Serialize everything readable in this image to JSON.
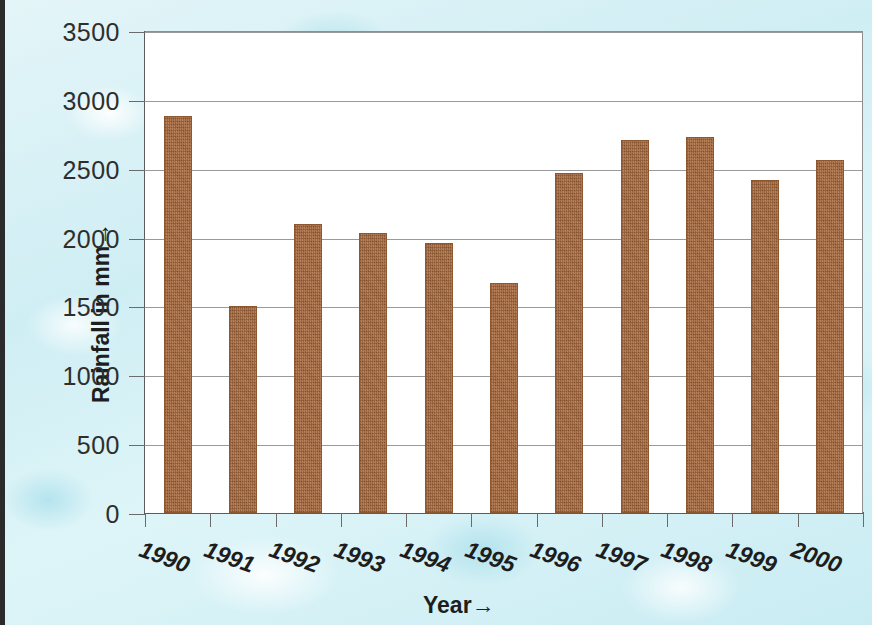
{
  "chart_data": {
    "type": "bar",
    "title": "",
    "xlabel": "Year→",
    "ylabel": "Rainfall in mm→",
    "categories": [
      "1990",
      "1991",
      "1992",
      "1993",
      "1994",
      "1995",
      "1996",
      "1997",
      "1998",
      "1999",
      "2000"
    ],
    "values": [
      2880,
      1500,
      2100,
      2030,
      1960,
      1670,
      2470,
      2710,
      2730,
      2420,
      2560
    ],
    "series": [
      {
        "name": "Rainfall",
        "values": [
          2880,
          1500,
          2100,
          2030,
          1960,
          1670,
          2470,
          2710,
          2730,
          2420,
          2560
        ]
      }
    ],
    "ylim": [
      0,
      3500
    ],
    "ytick_labels": [
      "0",
      "500",
      "1000",
      "1500",
      "2000",
      "2500",
      "3000",
      "3500"
    ],
    "ytick_values": [
      0,
      500,
      1000,
      1500,
      2000,
      2500,
      3000,
      3500
    ],
    "grid": true,
    "legend": false,
    "bar_color": "#a9693c",
    "plot_background": "#ffffff",
    "figure_background": "#d9f1f5",
    "gridline_color": "#9a9a9a",
    "axis_color": "#5c5c5c",
    "xtick_rotation": "-20"
  }
}
